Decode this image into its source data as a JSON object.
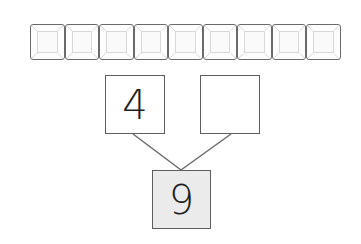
{
  "worksheet": {
    "counting_frame": {
      "cell_count": 9,
      "cells": [
        "",
        "",
        "",
        "",
        "",
        "",
        "",
        "",
        ""
      ]
    },
    "number_bond": {
      "part_left": "4",
      "part_right": "",
      "whole": "9"
    }
  },
  "colors": {
    "border": "#5e5e5e",
    "whole_fill": "#ebebeb",
    "line": "#6b6b6b"
  }
}
